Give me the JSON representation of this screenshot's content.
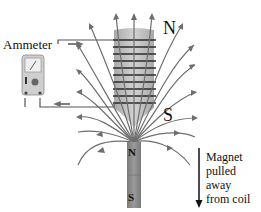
{
  "diagram": {
    "labels": {
      "ammeter": "Ammeter",
      "coil_top_pole": "N",
      "coil_bottom_pole": "S",
      "magnet_north": "N",
      "magnet_south": "S"
    },
    "caption": {
      "lines": [
        "Magnet",
        "pulled",
        "away",
        "from coil"
      ]
    },
    "colors": {
      "field_line": "#6e6e6e",
      "wire": "#555555",
      "coil_core": "#b8b8b8",
      "coil_wire": "#2a2a2a",
      "magnet": "#8a8a8a",
      "ammeter_body": "#c9c9c9",
      "text": "#111111"
    },
    "components": [
      "ammeter",
      "coil",
      "bar-magnet",
      "magnetic-field-lines",
      "motion-arrow",
      "current-arrows"
    ]
  }
}
